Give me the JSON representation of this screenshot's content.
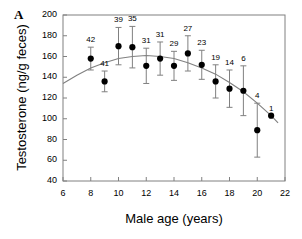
{
  "panel": {
    "label": "A"
  },
  "chart_data": {
    "type": "scatter",
    "title": "",
    "xlabel": "Male age (years)",
    "ylabel": "Testosterone (ng/g feces)",
    "xlim": [
      6,
      22
    ],
    "ylim": [
      40,
      200
    ],
    "xticks": [
      6,
      8,
      10,
      12,
      14,
      16,
      18,
      20,
      22
    ],
    "yticks": [
      40,
      60,
      80,
      100,
      120,
      140,
      160,
      180,
      200
    ],
    "grid": false,
    "legend": "none",
    "marker": "filled-circle",
    "errorbars": "vertical",
    "point_labels_meaning": "sample size n above each point",
    "x": [
      8,
      9,
      10,
      11,
      12,
      13,
      14,
      15,
      16,
      17,
      18,
      19,
      20,
      21
    ],
    "values": [
      158,
      136,
      170,
      169,
      151,
      158,
      151,
      163,
      152,
      136,
      129,
      127,
      89,
      103
    ],
    "err_up": [
      11,
      10,
      18,
      20,
      17,
      16,
      14,
      17,
      14,
      16,
      18,
      24,
      26,
      0
    ],
    "err_down": [
      11,
      10,
      18,
      20,
      17,
      16,
      14,
      17,
      14,
      16,
      18,
      24,
      26,
      0
    ],
    "n_labels": [
      "42",
      "41",
      "39",
      "35",
      "31",
      "31",
      "29",
      "27",
      "23",
      "19",
      "14",
      "6",
      "4",
      "1"
    ],
    "fit_curve": {
      "type": "quadratic",
      "x": [
        6,
        7,
        8,
        9,
        10,
        11,
        12,
        13,
        14,
        15,
        16,
        17,
        18,
        19,
        20,
        21,
        21.5
      ],
      "y": [
        134,
        142,
        149,
        154,
        158,
        160,
        161,
        160,
        158,
        154,
        149,
        143,
        135,
        126,
        115,
        103,
        96
      ]
    },
    "colors": {
      "marker": "#000000",
      "errorbar": "#808080",
      "curve": "#808080",
      "axis": "#808080",
      "text": "#000000"
    }
  }
}
